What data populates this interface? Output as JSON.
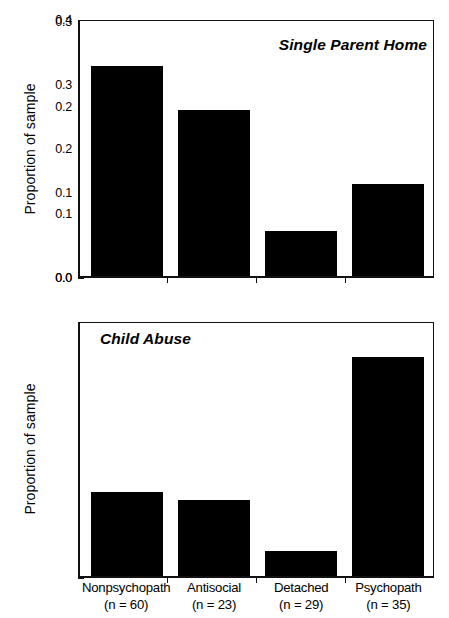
{
  "figure": {
    "background": "#ffffff",
    "bar_color": "#000000",
    "axis_color": "#111111"
  },
  "chart_data": [
    {
      "type": "bar",
      "title": "Single Parent Home",
      "panel": "top",
      "xlabel": "",
      "ylabel": "Proportion of sample",
      "categories": [
        "Nonpsychopath",
        "Antisocial",
        "Detached",
        "Psychopath"
      ],
      "values": [
        0.33,
        0.26,
        0.07,
        0.145
      ],
      "ylim": [
        0.0,
        0.4
      ],
      "yticks": [
        "0.4",
        "0.3",
        "0.2",
        "0.1",
        "0.0"
      ],
      "ytick_values": [
        0.4,
        0.3,
        0.2,
        0.1,
        0.0
      ],
      "grid": false,
      "legend": "none"
    },
    {
      "type": "bar",
      "title": "Child Abuse",
      "panel": "bottom",
      "xlabel": "",
      "ylabel": "Proportion of sample",
      "categories": [
        "Nonpsychopath",
        "Antisocial",
        "Detached",
        "Psychopath"
      ],
      "values": [
        0.1,
        0.09,
        0.03,
        0.26
      ],
      "ylim": [
        0.0,
        0.3
      ],
      "yticks": [
        "0.3",
        "0.2",
        "0.1",
        "0.0"
      ],
      "ytick_values": [
        0.3,
        0.2,
        0.1,
        0.0
      ],
      "grid": false,
      "legend": "none"
    }
  ],
  "x_axis": {
    "groups": [
      {
        "name": "Nonpsychopath",
        "n_label": "(n = 60)",
        "n": 60
      },
      {
        "name": "Antisocial",
        "n_label": "(n = 23)",
        "n": 23
      },
      {
        "name": "Detached",
        "n_label": "(n = 29)",
        "n": 29
      },
      {
        "name": "Psychopath",
        "n_label": "(n = 35)",
        "n": 35
      }
    ]
  }
}
